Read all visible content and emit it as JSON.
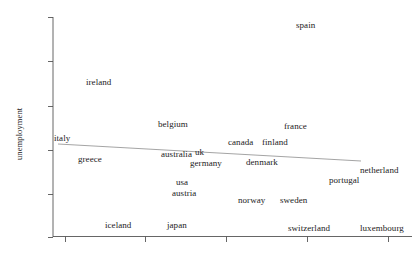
{
  "chart_data": {
    "type": "scatter",
    "title": "",
    "subtitle": "",
    "xlabel": "",
    "ylabel": "unemployment",
    "grid": false,
    "legend": null,
    "axis": {
      "x": {
        "line_from_px": 53,
        "line_to_px": 412,
        "tick_positions_px": [
          65,
          145,
          226,
          307,
          388
        ],
        "tick_labels": [
          "",
          "",
          "",
          "",
          ""
        ]
      },
      "y": {
        "line_from_px": 17,
        "line_to_px": 237,
        "tick_positions_px": [
          17,
          61,
          106,
          150,
          194,
          237
        ],
        "tick_labels": [
          "",
          "",
          "",
          "",
          "",
          ""
        ]
      }
    },
    "fit_line": {
      "name": "regression-line",
      "x0_px": 58,
      "y0_px": 144,
      "x1_px": 361,
      "y1_px": 161,
      "color": "#9a9a9a"
    },
    "point_label_style": "text-only",
    "points": [
      {
        "label": "spain",
        "x_px": 296,
        "y_px": 21
      },
      {
        "label": "ireland",
        "x_px": 86,
        "y_px": 78
      },
      {
        "label": "belgium",
        "x_px": 158,
        "y_px": 120
      },
      {
        "label": "france",
        "x_px": 284,
        "y_px": 122
      },
      {
        "label": "italy",
        "x_px": 54,
        "y_px": 134
      },
      {
        "label": "canada",
        "x_px": 228,
        "y_px": 138
      },
      {
        "label": "finland",
        "x_px": 262,
        "y_px": 138
      },
      {
        "label": "australia",
        "x_px": 161,
        "y_px": 150
      },
      {
        "label": "uk",
        "x_px": 195,
        "y_px": 148
      },
      {
        "label": "greece",
        "x_px": 78,
        "y_px": 155
      },
      {
        "label": "germany",
        "x_px": 190,
        "y_px": 159
      },
      {
        "label": "denmark",
        "x_px": 246,
        "y_px": 158
      },
      {
        "label": "netherland",
        "x_px": 360,
        "y_px": 166
      },
      {
        "label": "portugal",
        "x_px": 329,
        "y_px": 176
      },
      {
        "label": "usa",
        "x_px": 176,
        "y_px": 178
      },
      {
        "label": "austria",
        "x_px": 172,
        "y_px": 189
      },
      {
        "label": "norway",
        "x_px": 238,
        "y_px": 196
      },
      {
        "label": "sweden",
        "x_px": 280,
        "y_px": 196
      },
      {
        "label": "iceland",
        "x_px": 105,
        "y_px": 221
      },
      {
        "label": "japan",
        "x_px": 167,
        "y_px": 221
      },
      {
        "label": "switzerland",
        "x_px": 288,
        "y_px": 224
      },
      {
        "label": "luxembourg",
        "x_px": 360,
        "y_px": 224
      }
    ]
  },
  "colors": {
    "axis": "#555555",
    "text": "#1b1b1b",
    "fit_line": "#9a9a9a",
    "background": "#ffffff"
  }
}
